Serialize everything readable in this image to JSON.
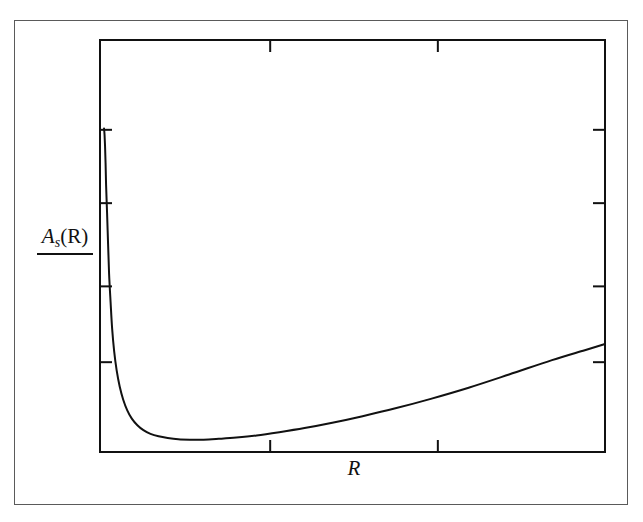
{
  "figure": {
    "background_color": "#ffffff",
    "ink_color": "#111111",
    "frame_color": "#5a5a5a",
    "y_axis_label_main": "A",
    "y_axis_label_sub": "s",
    "y_axis_label_arg": "(R)",
    "x_axis_label": "R"
  },
  "chart_data": {
    "type": "line",
    "title": "",
    "subtitle": "",
    "xlabel": "R",
    "ylabel": "A_s(R)",
    "legend": [],
    "legend_position": "none",
    "grid": false,
    "axis_box": true,
    "tick_direction": "in",
    "xlim": [
      0,
      1
    ],
    "ylim": [
      0,
      1
    ],
    "xticks_normalized": [
      0.337,
      0.669
    ],
    "yticks_normalized": [
      0.218,
      0.402,
      0.604,
      0.782
    ],
    "xtick_labels": [
      "",
      ""
    ],
    "ytick_labels": [
      "",
      "",
      "",
      ""
    ],
    "series": [
      {
        "name": "A_s(R)",
        "color": "#111111",
        "linewidth": 2.0,
        "x": [
          0.008,
          0.009,
          0.01,
          0.011,
          0.012,
          0.014,
          0.016,
          0.018,
          0.021,
          0.024,
          0.028,
          0.033,
          0.039,
          0.046,
          0.054,
          0.063,
          0.074,
          0.086,
          0.1,
          0.116,
          0.134,
          0.155,
          0.178,
          0.205,
          0.235,
          0.27,
          0.31,
          0.355,
          0.405,
          0.46,
          0.52,
          0.585,
          0.655,
          0.73,
          0.81,
          0.895,
          0.96,
          1.0
        ],
        "y": [
          0.785,
          0.77,
          0.742,
          0.702,
          0.65,
          0.58,
          0.505,
          0.432,
          0.363,
          0.3,
          0.245,
          0.198,
          0.159,
          0.127,
          0.101,
          0.081,
          0.065,
          0.053,
          0.044,
          0.038,
          0.034,
          0.031,
          0.03,
          0.03,
          0.032,
          0.035,
          0.04,
          0.048,
          0.058,
          0.071,
          0.087,
          0.106,
          0.129,
          0.156,
          0.188,
          0.223,
          0.247,
          0.262
        ]
      }
    ]
  },
  "plot_geometry": {
    "outer_frame": {
      "x": 14,
      "y": 20,
      "width": 614,
      "height": 485
    },
    "axes_box": {
      "x": 100,
      "y": 40,
      "width": 505,
      "height": 412
    }
  }
}
